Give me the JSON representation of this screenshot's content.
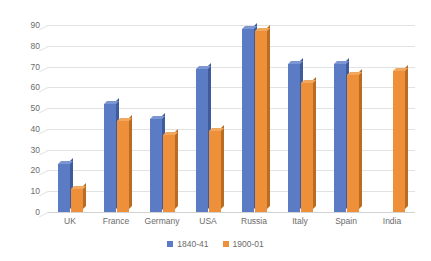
{
  "chart_data": {
    "type": "bar",
    "title": "",
    "subtitle": "",
    "xlabel": "",
    "ylabel": "",
    "ylim": [
      0,
      90
    ],
    "ytick_step": 10,
    "yticks": [
      "0",
      "10",
      "20",
      "30",
      "40",
      "50",
      "60",
      "70",
      "80",
      "90"
    ],
    "grid": true,
    "legend_position": "bottom",
    "categories": [
      "UK",
      "France",
      "Germany",
      "USA",
      "Russia",
      "Italy",
      "Spain",
      "India"
    ],
    "series": [
      {
        "name": "1840-41",
        "color": "#5b7bc4",
        "values": [
          23,
          52,
          45,
          69,
          88,
          71,
          71,
          null
        ]
      },
      {
        "name": "1900-01",
        "color": "#ed9039",
        "values": [
          11,
          44,
          37,
          39,
          87,
          62,
          66,
          68
        ]
      }
    ]
  },
  "legend": {
    "items": [
      {
        "label": "1840-41",
        "color": "#5b7bc4"
      },
      {
        "label": "1900-01",
        "color": "#ed9039"
      }
    ]
  },
  "colors": {
    "series_1840_41": "#5b7bc4",
    "series_1900_01": "#ed9039",
    "gridline": "#e2e2e2",
    "axis_text": "#6b6b6b",
    "background": "#ffffff"
  }
}
